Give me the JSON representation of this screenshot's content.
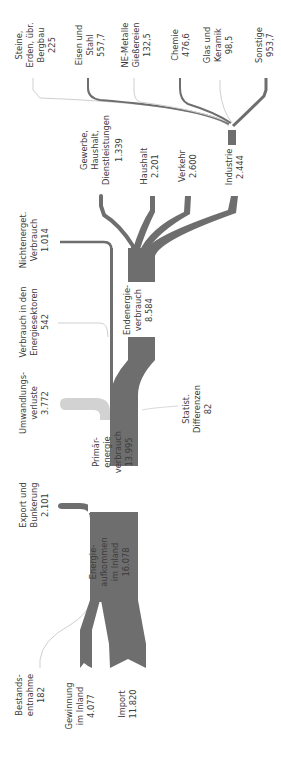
{
  "diagram": {
    "type": "sankey",
    "orientation": "rotated-90-ccw",
    "title_partial": "",
    "colors": {
      "main_flow": "#6e6e6e",
      "loss_flow": "#d2d2d2",
      "text": "#3c3c3c"
    }
  },
  "sources": {
    "bestand": {
      "label1": "Bestands-",
      "label2": "entnahme",
      "value": "182"
    },
    "gewinnung": {
      "label1": "Gewinnung",
      "label2": "im Inland",
      "value": "4.077"
    },
    "import": {
      "label1": "Import",
      "value": "11.820"
    }
  },
  "nodes": {
    "aufkommen": {
      "label1": "Energie-",
      "label2": "aufkommen",
      "label3": "im Inland",
      "value": "16.078"
    },
    "primaer": {
      "label1": "Primär-",
      "label2": "energie",
      "label3": "verbrauch",
      "value": "13.995"
    },
    "endenergie": {
      "label1": "Endenergie-",
      "label2": "verbrauch",
      "value": "8.584"
    }
  },
  "outflows": {
    "export": {
      "label1": "Export und",
      "label2": "Bunkerung",
      "value": "2.101"
    },
    "umwandlung": {
      "label1": "Umwandlungs-",
      "label2": "verluste",
      "value": "3.772"
    },
    "statist": {
      "label1": "Statist.",
      "label2": "Differenzen",
      "value": "82"
    },
    "energiesektoren": {
      "label1": "Verbrauch in den",
      "label2": "Energiesektoren",
      "value": "542"
    },
    "nichtenerget": {
      "label1": "Nichtenerget.",
      "label2": "Verbrauch",
      "value": "1.014"
    }
  },
  "sectors": {
    "gewerbe": {
      "label1": "Gewerbe,",
      "label2": "Haushalt,",
      "label3": "Dienstleistungen",
      "value": "1.339"
    },
    "haushalt": {
      "label1": "Haushalt",
      "value": "2.201"
    },
    "verkehr": {
      "label1": "Verkehr",
      "value": "2.600"
    },
    "industrie": {
      "label1": "Industrie",
      "value": "2.444"
    }
  },
  "industry_branches": {
    "steine": {
      "label1": "Steine,",
      "label2": "Erden, übr.",
      "label3": "Bergbau",
      "value": "225"
    },
    "eisen": {
      "label1": "Eisen und",
      "label2": "Stahl",
      "value": "557,7"
    },
    "ne": {
      "label1": "NE-Metalle",
      "label2": "Gießereien",
      "value": "132,5"
    },
    "chemie": {
      "label1": "Chemie",
      "value": "476,6"
    },
    "glas": {
      "label1": "Glas und",
      "label2": "Keramik",
      "value": "98,5"
    },
    "sonstige": {
      "label1": "Sonstige",
      "value": "953,7"
    }
  }
}
